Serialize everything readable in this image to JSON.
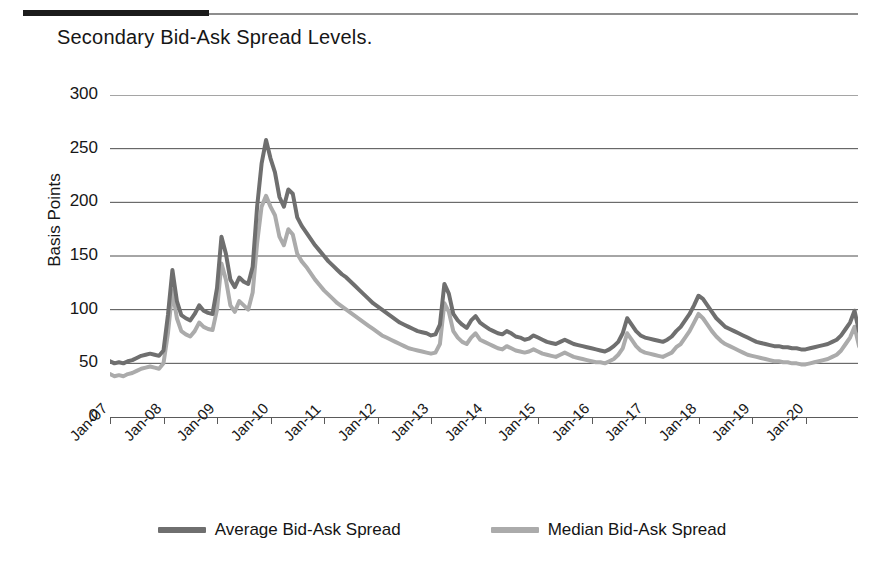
{
  "title": "Secondary Bid-Ask Spread Levels.",
  "legend": [
    {
      "label": "Average Bid-Ask Spread",
      "color": "#6f6f6f"
    },
    {
      "label": "Median Bid-Ask Spread",
      "color": "#ababab"
    }
  ],
  "chart_data": {
    "type": "line",
    "title": "Secondary Bid-Ask Spread Levels.",
    "xlabel": "",
    "ylabel": "Basis Points",
    "ylim": [
      0,
      300
    ],
    "yticks": [
      0,
      50,
      100,
      150,
      200,
      250,
      300
    ],
    "xticks": [
      "Jan-07",
      "Jan-08",
      "Jan-09",
      "Jan-10",
      "Jan-11",
      "Jan-12",
      "Jan-13",
      "Jan-14",
      "Jan-15",
      "Jan-16",
      "Jan-17",
      "Jan-18",
      "Jan-19",
      "Jan-20"
    ],
    "grid": true,
    "legend_position": "bottom",
    "x_start": "Jan-07",
    "x_step_months": 1,
    "series": [
      {
        "name": "Average Bid-Ask Spread",
        "color": "#6f6f6f",
        "values": [
          52,
          50,
          51,
          50,
          52,
          53,
          55,
          57,
          58,
          59,
          58,
          57,
          62,
          95,
          137,
          108,
          95,
          92,
          90,
          96,
          104,
          99,
          97,
          96,
          120,
          168,
          152,
          128,
          121,
          130,
          126,
          124,
          140,
          196,
          236,
          258,
          241,
          228,
          205,
          196,
          212,
          208,
          186,
          178,
          172,
          166,
          160,
          155,
          150,
          145,
          141,
          137,
          133,
          130,
          126,
          122,
          118,
          114,
          110,
          106,
          103,
          100,
          97,
          94,
          91,
          88,
          86,
          84,
          82,
          80,
          79,
          78,
          76,
          77,
          86,
          124,
          115,
          96,
          90,
          86,
          83,
          90,
          94,
          88,
          85,
          82,
          80,
          78,
          77,
          80,
          78,
          75,
          74,
          72,
          73,
          76,
          74,
          72,
          70,
          69,
          68,
          70,
          72,
          70,
          68,
          67,
          66,
          65,
          64,
          63,
          62,
          61,
          63,
          66,
          70,
          78,
          92,
          86,
          80,
          76,
          74,
          73,
          72,
          71,
          70,
          72,
          75,
          80,
          84,
          90,
          96,
          104,
          113,
          110,
          104,
          98,
          92,
          88,
          84,
          82,
          80,
          78,
          76,
          74,
          72,
          70,
          69,
          68,
          67,
          66,
          66,
          65,
          65,
          64,
          64,
          63,
          63,
          64,
          65,
          66,
          67,
          68,
          70,
          72,
          76,
          82,
          88,
          99,
          80,
          72,
          70,
          69,
          70,
          72,
          78,
          85,
          92,
          88,
          82,
          76,
          74,
          112,
          272,
          230,
          170,
          140,
          122,
          114,
          108,
          104,
          100,
          96,
          94,
          92,
          90
        ]
      },
      {
        "name": "Median Bid-Ask Spread",
        "color": "#ababab",
        "values": [
          40,
          38,
          39,
          38,
          40,
          41,
          43,
          45,
          46,
          47,
          46,
          45,
          50,
          78,
          118,
          92,
          80,
          77,
          75,
          80,
          88,
          84,
          82,
          81,
          100,
          143,
          128,
          104,
          98,
          108,
          104,
          100,
          116,
          162,
          196,
          206,
          196,
          188,
          168,
          160,
          175,
          170,
          152,
          145,
          140,
          134,
          128,
          123,
          118,
          114,
          110,
          106,
          103,
          100,
          97,
          94,
          91,
          88,
          85,
          82,
          79,
          76,
          74,
          72,
          70,
          68,
          66,
          64,
          63,
          62,
          61,
          60,
          59,
          60,
          68,
          106,
          98,
          80,
          74,
          70,
          68,
          74,
          78,
          72,
          70,
          68,
          66,
          64,
          63,
          66,
          64,
          62,
          61,
          60,
          61,
          63,
          61,
          59,
          58,
          57,
          56,
          58,
          60,
          58,
          56,
          55,
          54,
          53,
          52,
          51,
          51,
          50,
          52,
          54,
          58,
          64,
          78,
          72,
          66,
          62,
          60,
          59,
          58,
          57,
          56,
          58,
          60,
          65,
          68,
          74,
          80,
          88,
          96,
          92,
          86,
          80,
          75,
          71,
          68,
          66,
          64,
          62,
          60,
          58,
          57,
          56,
          55,
          54,
          53,
          52,
          52,
          51,
          51,
          50,
          50,
          49,
          49,
          50,
          51,
          52,
          53,
          54,
          56,
          58,
          62,
          68,
          74,
          84,
          66,
          58,
          56,
          55,
          56,
          58,
          64,
          70,
          78,
          74,
          68,
          63,
          61,
          96,
          258,
          210,
          150,
          120,
          104,
          96,
          90,
          86,
          82,
          80,
          78,
          77,
          76
        ]
      }
    ]
  }
}
